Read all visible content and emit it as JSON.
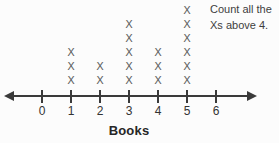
{
  "instruction": {
    "line1": "Count all the",
    "line2": "Xs above 4."
  },
  "chart_data": {
    "type": "line_plot",
    "marker": "X",
    "title": "",
    "xlabel": "Books",
    "categories": [
      0,
      1,
      2,
      3,
      4,
      5,
      6
    ],
    "values": [
      0,
      3,
      2,
      5,
      3,
      6,
      0
    ],
    "annotation": "Count all the Xs above 4.",
    "axis": {
      "arrows": "both",
      "tick_labels": [
        "0",
        "1",
        "2",
        "3",
        "4",
        "5",
        "6"
      ],
      "xlim": [
        0,
        6
      ],
      "grid": false
    }
  },
  "colors": {
    "background": "#fcfcfc",
    "marker": "#616161",
    "axis": "#3a3a3a",
    "text": "#3e3e3e"
  }
}
